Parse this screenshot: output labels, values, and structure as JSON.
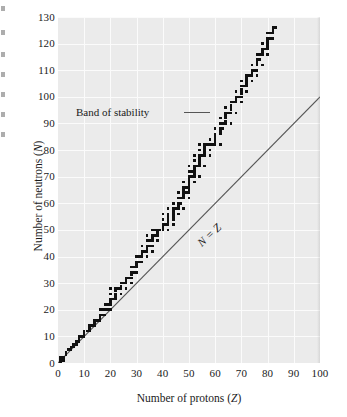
{
  "figure": {
    "kind": "scientific-figure",
    "background_color": "#ffffff",
    "panel_color": "#ebebeb",
    "gridline_color": "#fbfbfb",
    "marker_color": "#111111",
    "line_color": "#555555"
  },
  "axes": {
    "x_title_plain": "Number of protons (",
    "x_title_symbol": "Z",
    "x_title_close": ")",
    "y_title_plain": "Number of neutrons (",
    "y_title_symbol": "N",
    "y_title_close": ")"
  },
  "annotations": {
    "band_label": "Band of stability",
    "nz_label": "N = Z"
  },
  "chart_data": {
    "type": "scatter",
    "title": "",
    "subtitle": "",
    "xlabel": "Number of protons (Z)",
    "ylabel": "Number of neutrons (N)",
    "xlim": [
      0,
      100
    ],
    "ylim": [
      0,
      130
    ],
    "xticks": [
      0,
      10,
      20,
      30,
      40,
      50,
      60,
      70,
      80,
      90,
      100
    ],
    "yticks": [
      0,
      10,
      20,
      30,
      40,
      50,
      60,
      70,
      80,
      90,
      100,
      110,
      120,
      130
    ],
    "grid": true,
    "legend": "none",
    "annotations": [
      {
        "text": "Band of stability",
        "leader_line": true,
        "points_to": {
          "x": 62,
          "y": 95
        }
      },
      {
        "text": "N = Z",
        "rotated": true,
        "along_series": "reference_line"
      }
    ],
    "series": [
      {
        "name": "Stable nuclides (band of stability)",
        "type": "scatter",
        "marker": "square",
        "color": "#111111",
        "points": [
          [
            1,
            0
          ],
          [
            1,
            1
          ],
          [
            1,
            2
          ],
          [
            2,
            1
          ],
          [
            2,
            2
          ],
          [
            3,
            3
          ],
          [
            3,
            4
          ],
          [
            4,
            5
          ],
          [
            5,
            5
          ],
          [
            5,
            6
          ],
          [
            6,
            6
          ],
          [
            6,
            7
          ],
          [
            7,
            7
          ],
          [
            7,
            8
          ],
          [
            8,
            8
          ],
          [
            8,
            9
          ],
          [
            8,
            10
          ],
          [
            9,
            10
          ],
          [
            10,
            10
          ],
          [
            10,
            11
          ],
          [
            10,
            12
          ],
          [
            11,
            12
          ],
          [
            12,
            12
          ],
          [
            12,
            13
          ],
          [
            12,
            14
          ],
          [
            13,
            14
          ],
          [
            14,
            14
          ],
          [
            14,
            15
          ],
          [
            14,
            16
          ],
          [
            15,
            16
          ],
          [
            16,
            16
          ],
          [
            16,
            17
          ],
          [
            16,
            18
          ],
          [
            16,
            20
          ],
          [
            17,
            18
          ],
          [
            17,
            20
          ],
          [
            18,
            18
          ],
          [
            18,
            20
          ],
          [
            18,
            22
          ],
          [
            19,
            20
          ],
          [
            19,
            22
          ],
          [
            20,
            20
          ],
          [
            20,
            22
          ],
          [
            20,
            23
          ],
          [
            20,
            24
          ],
          [
            20,
            26
          ],
          [
            20,
            28
          ],
          [
            21,
            24
          ],
          [
            22,
            24
          ],
          [
            22,
            25
          ],
          [
            22,
            26
          ],
          [
            22,
            27
          ],
          [
            22,
            28
          ],
          [
            23,
            28
          ],
          [
            24,
            26
          ],
          [
            24,
            28
          ],
          [
            24,
            29
          ],
          [
            24,
            30
          ],
          [
            25,
            30
          ],
          [
            26,
            28
          ],
          [
            26,
            30
          ],
          [
            26,
            31
          ],
          [
            26,
            32
          ],
          [
            27,
            32
          ],
          [
            28,
            30
          ],
          [
            28,
            32
          ],
          [
            28,
            33
          ],
          [
            28,
            34
          ],
          [
            28,
            36
          ],
          [
            29,
            34
          ],
          [
            29,
            36
          ],
          [
            30,
            34
          ],
          [
            30,
            36
          ],
          [
            30,
            37
          ],
          [
            30,
            38
          ],
          [
            30,
            40
          ],
          [
            31,
            38
          ],
          [
            31,
            40
          ],
          [
            32,
            38
          ],
          [
            32,
            40
          ],
          [
            32,
            41
          ],
          [
            32,
            42
          ],
          [
            32,
            44
          ],
          [
            33,
            42
          ],
          [
            34,
            40
          ],
          [
            34,
            42
          ],
          [
            34,
            43
          ],
          [
            34,
            44
          ],
          [
            34,
            46
          ],
          [
            34,
            48
          ],
          [
            35,
            44
          ],
          [
            35,
            46
          ],
          [
            36,
            42
          ],
          [
            36,
            44
          ],
          [
            36,
            46
          ],
          [
            36,
            47
          ],
          [
            36,
            48
          ],
          [
            36,
            50
          ],
          [
            37,
            48
          ],
          [
            37,
            50
          ],
          [
            38,
            46
          ],
          [
            38,
            48
          ],
          [
            38,
            49
          ],
          [
            38,
            50
          ],
          [
            39,
            50
          ],
          [
            40,
            50
          ],
          [
            40,
            51
          ],
          [
            40,
            52
          ],
          [
            40,
            54
          ],
          [
            40,
            56
          ],
          [
            41,
            52
          ],
          [
            42,
            50
          ],
          [
            42,
            52
          ],
          [
            42,
            53
          ],
          [
            42,
            54
          ],
          [
            42,
            55
          ],
          [
            42,
            56
          ],
          [
            42,
            58
          ],
          [
            44,
            52
          ],
          [
            44,
            54
          ],
          [
            44,
            55
          ],
          [
            44,
            56
          ],
          [
            44,
            57
          ],
          [
            44,
            58
          ],
          [
            44,
            60
          ],
          [
            45,
            58
          ],
          [
            46,
            56
          ],
          [
            46,
            58
          ],
          [
            46,
            59
          ],
          [
            46,
            60
          ],
          [
            46,
            62
          ],
          [
            46,
            64
          ],
          [
            47,
            60
          ],
          [
            47,
            62
          ],
          [
            48,
            58
          ],
          [
            48,
            62
          ],
          [
            48,
            63
          ],
          [
            48,
            64
          ],
          [
            48,
            65
          ],
          [
            48,
            66
          ],
          [
            48,
            68
          ],
          [
            49,
            64
          ],
          [
            49,
            66
          ],
          [
            50,
            62
          ],
          [
            50,
            64
          ],
          [
            50,
            65
          ],
          [
            50,
            66
          ],
          [
            50,
            67
          ],
          [
            50,
            68
          ],
          [
            50,
            69
          ],
          [
            50,
            70
          ],
          [
            50,
            72
          ],
          [
            50,
            74
          ],
          [
            51,
            70
          ],
          [
            51,
            72
          ],
          [
            52,
            68
          ],
          [
            52,
            70
          ],
          [
            52,
            71
          ],
          [
            52,
            72
          ],
          [
            52,
            73
          ],
          [
            52,
            74
          ],
          [
            52,
            76
          ],
          [
            52,
            78
          ],
          [
            53,
            74
          ],
          [
            54,
            70
          ],
          [
            54,
            74
          ],
          [
            54,
            75
          ],
          [
            54,
            76
          ],
          [
            54,
            77
          ],
          [
            54,
            78
          ],
          [
            54,
            80
          ],
          [
            54,
            82
          ],
          [
            55,
            78
          ],
          [
            56,
            74
          ],
          [
            56,
            78
          ],
          [
            56,
            79
          ],
          [
            56,
            80
          ],
          [
            56,
            81
          ],
          [
            56,
            82
          ],
          [
            57,
            82
          ],
          [
            58,
            78
          ],
          [
            58,
            80
          ],
          [
            58,
            82
          ],
          [
            58,
            84
          ],
          [
            59,
            82
          ],
          [
            60,
            82
          ],
          [
            60,
            83
          ],
          [
            60,
            84
          ],
          [
            60,
            85
          ],
          [
            60,
            86
          ],
          [
            60,
            88
          ],
          [
            62,
            82
          ],
          [
            62,
            86
          ],
          [
            62,
            87
          ],
          [
            62,
            88
          ],
          [
            62,
            90
          ],
          [
            62,
            92
          ],
          [
            63,
            88
          ],
          [
            63,
            90
          ],
          [
            64,
            90
          ],
          [
            64,
            91
          ],
          [
            64,
            92
          ],
          [
            64,
            93
          ],
          [
            64,
            94
          ],
          [
            64,
            96
          ],
          [
            65,
            94
          ],
          [
            66,
            90
          ],
          [
            66,
            94
          ],
          [
            66,
            95
          ],
          [
            66,
            96
          ],
          [
            66,
            97
          ],
          [
            66,
            98
          ],
          [
            67,
            98
          ],
          [
            68,
            94
          ],
          [
            68,
            98
          ],
          [
            68,
            99
          ],
          [
            68,
            100
          ],
          [
            68,
            102
          ],
          [
            69,
            100
          ],
          [
            70,
            98
          ],
          [
            70,
            100
          ],
          [
            70,
            101
          ],
          [
            70,
            102
          ],
          [
            70,
            103
          ],
          [
            70,
            104
          ],
          [
            70,
            106
          ],
          [
            71,
            104
          ],
          [
            72,
            102
          ],
          [
            72,
            104
          ],
          [
            72,
            105
          ],
          [
            72,
            106
          ],
          [
            72,
            107
          ],
          [
            72,
            108
          ],
          [
            73,
            108
          ],
          [
            74,
            106
          ],
          [
            74,
            108
          ],
          [
            74,
            109
          ],
          [
            74,
            110
          ],
          [
            74,
            112
          ],
          [
            75,
            110
          ],
          [
            76,
            108
          ],
          [
            76,
            110
          ],
          [
            76,
            112
          ],
          [
            76,
            113
          ],
          [
            76,
            114
          ],
          [
            76,
            116
          ],
          [
            77,
            114
          ],
          [
            77,
            116
          ],
          [
            78,
            112
          ],
          [
            78,
            116
          ],
          [
            78,
            117
          ],
          [
            78,
            118
          ],
          [
            78,
            120
          ],
          [
            79,
            118
          ],
          [
            80,
            116
          ],
          [
            80,
            118
          ],
          [
            80,
            119
          ],
          [
            80,
            120
          ],
          [
            80,
            121
          ],
          [
            80,
            122
          ],
          [
            80,
            124
          ],
          [
            81,
            122
          ],
          [
            81,
            124
          ],
          [
            82,
            122
          ],
          [
            82,
            124
          ],
          [
            82,
            125
          ],
          [
            82,
            126
          ],
          [
            83,
            126
          ]
        ]
      },
      {
        "name": "N = Z reference line",
        "type": "line",
        "color": "#555555",
        "points": [
          [
            0,
            0
          ],
          [
            100,
            100
          ]
        ]
      }
    ]
  }
}
